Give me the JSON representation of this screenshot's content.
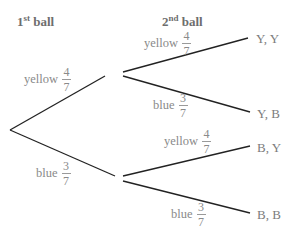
{
  "headers": {
    "first": {
      "num": "1",
      "sup": "st",
      "text": " ball"
    },
    "second": {
      "num": "2",
      "sup": "nd",
      "text": " ball"
    }
  },
  "first_level": {
    "upper": {
      "color": "yellow",
      "num": "4",
      "den": "7"
    },
    "lower": {
      "color": "blue",
      "num": "3",
      "den": "7"
    }
  },
  "second_level": {
    "from_yellow": {
      "upper": {
        "color": "yellow",
        "num": "4",
        "den": "7",
        "outcome": "Y, Y"
      },
      "lower": {
        "color": "blue",
        "num": "3",
        "den": "7",
        "outcome": "Y, B"
      }
    },
    "from_blue": {
      "upper": {
        "color": "yellow",
        "num": "4",
        "den": "7",
        "outcome": "B, Y"
      },
      "lower": {
        "color": "blue",
        "num": "3",
        "den": "7",
        "outcome": "B, B"
      }
    }
  },
  "line_color": "#222222"
}
